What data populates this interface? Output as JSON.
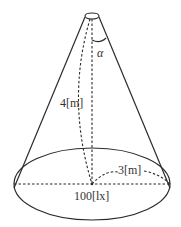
{
  "diagram": {
    "type": "cone-illumination",
    "labels": {
      "angle": "α",
      "height": "4[m]",
      "radius": "3[m]",
      "illuminance": "100[lx]"
    },
    "geometry": {
      "apex": {
        "cx": 92,
        "cy": 16,
        "rx": 7,
        "ry": 3
      },
      "base": {
        "cx": 92,
        "cy": 184,
        "rx": 78,
        "ry": 36
      }
    },
    "colors": {
      "stroke": "#2b2b2b",
      "text": "#333333",
      "background": "#ffffff"
    }
  }
}
